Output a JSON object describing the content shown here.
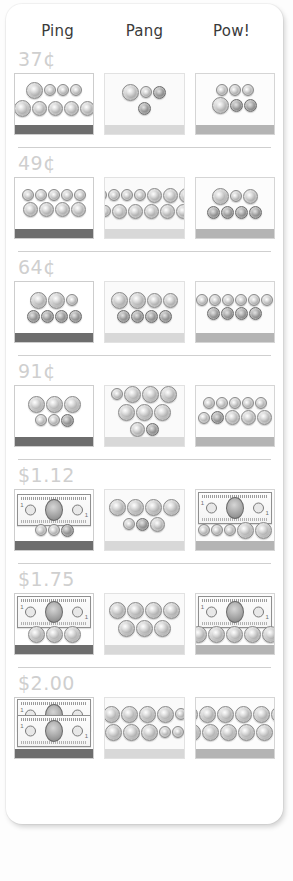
{
  "card": {
    "columns": [
      {
        "label": "Ping",
        "key": "ping"
      },
      {
        "label": "Pang",
        "key": "pang"
      },
      {
        "label": "Pow!",
        "key": "pow"
      }
    ],
    "rows": [
      {
        "price": "37¢",
        "cells": [
          {
            "column": "Ping",
            "tray_base_color": "#6d6d6d",
            "item_count": 7,
            "items": "1 quarter, 3 dimes top row; 1 quarter, 4 nickels bottom row"
          },
          {
            "column": "Pang",
            "tray_base_color": "#d8d8d8",
            "item_count": 4,
            "items": "1 quarter, 1 dime, 2 pennies"
          },
          {
            "column": "Pow!",
            "tray_base_color": "#b4b4b4",
            "item_count": 6,
            "items": "3 coins top row, 3 coins bottom row"
          }
        ]
      },
      {
        "price": "49¢",
        "cells": [
          {
            "column": "Ping",
            "tray_base_color": "#6d6d6d",
            "item_count": 9,
            "items": "5 coins top row, 4 coins bottom row"
          },
          {
            "column": "Pang",
            "tray_base_color": "#d8d8d8",
            "item_count": 13,
            "items": "7 coins top row, 6 coins bottom row"
          },
          {
            "column": "Pow!",
            "tray_base_color": "#b4b4b4",
            "item_count": 7,
            "items": "3 coins top row, 4 coins bottom row"
          }
        ]
      },
      {
        "price": "64¢",
        "cells": [
          {
            "column": "Ping",
            "tray_base_color": "#6d6d6d",
            "item_count": 7,
            "items": "3 coins top row, 4 coins bottom row"
          },
          {
            "column": "Pang",
            "tray_base_color": "#d8d8d8",
            "item_count": 8,
            "items": "4 coins top row, 4 coins bottom row"
          },
          {
            "column": "Pow!",
            "tray_base_color": "#b4b4b4",
            "item_count": 12,
            "items": "8 coins top row, 4 coins bottom row"
          }
        ]
      },
      {
        "price": "91¢",
        "cells": [
          {
            "column": "Ping",
            "tray_base_color": "#6d6d6d",
            "item_count": 6,
            "items": "3 coins top row, 3 coins bottom row"
          },
          {
            "column": "Pang",
            "tray_base_color": "#d8d8d8",
            "item_count": 9,
            "items": "1 coin left, 3 coins top, 3 coins middle, 2 coins bottom"
          },
          {
            "column": "Pow!",
            "tray_base_color": "#b4b4b4",
            "item_count": 11,
            "items": "5 coins top row, 6 coins bottom row"
          }
        ]
      },
      {
        "price": "$1.12",
        "cells": [
          {
            "column": "Ping",
            "tray_base_color": "#6d6d6d",
            "item_count": 4,
            "items": "1 dollar bill, 3 coins"
          },
          {
            "column": "Pang",
            "tray_base_color": "#d8d8d8",
            "item_count": 7,
            "items": "4 coins top row, 3 coins bottom row"
          },
          {
            "column": "Pow!",
            "tray_base_color": "#b4b4b4",
            "item_count": 6,
            "items": "1 dollar bill, 5 coins"
          }
        ]
      },
      {
        "price": "$1.75",
        "cells": [
          {
            "column": "Ping",
            "tray_base_color": "#6d6d6d",
            "item_count": 4,
            "items": "1 dollar bill, 3 coins"
          },
          {
            "column": "Pang",
            "tray_base_color": "#d8d8d8",
            "item_count": 7,
            "items": "4 coins top row, 3 coins bottom row"
          },
          {
            "column": "Pow!",
            "tray_base_color": "#b4b4b4",
            "item_count": 6,
            "items": "1 dollar bill, 5 coins"
          }
        ]
      },
      {
        "price": "$2.00",
        "cells": [
          {
            "column": "Ping",
            "tray_base_color": "#6d6d6d",
            "item_count": 2,
            "items": "2 dollar bills stacked"
          },
          {
            "column": "Pang",
            "tray_base_color": "#d8d8d8",
            "item_count": 10,
            "items": "5 coins top row, 5 coins bottom row"
          },
          {
            "column": "Pow!",
            "tray_base_color": "#b4b4b4",
            "item_count": 12,
            "items": "6 coins top row, 6 coins bottom row"
          }
        ]
      }
    ]
  }
}
